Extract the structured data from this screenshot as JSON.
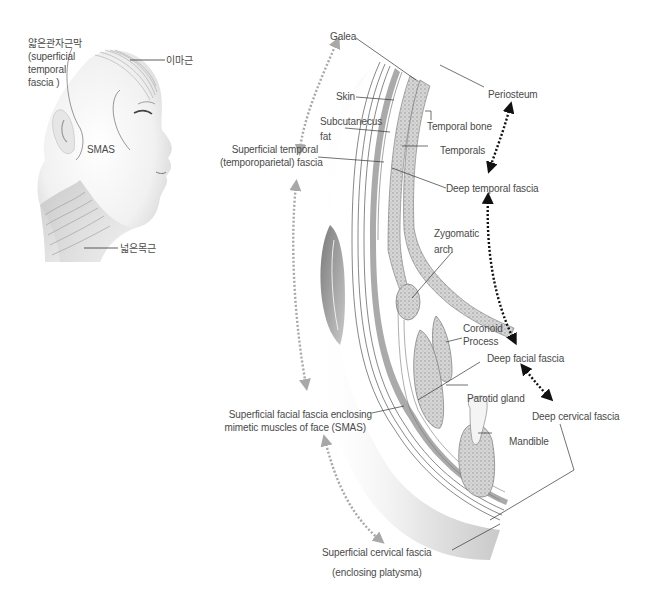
{
  "figure": {
    "face_panel": {
      "labels": {
        "superficial_temporal_kr": "얇은관자근막",
        "superficial_temporal_en_1": "(superficial",
        "superficial_temporal_en_2": "temporal",
        "superficial_temporal_en_3": "fascia )",
        "frontalis_kr": "이마근",
        "smas": "SMAS",
        "platysma_kr": "넓은목근"
      }
    },
    "section_panel": {
      "labels": {
        "galea": "Galea",
        "skin": "Skin",
        "subcutaneous_1": "Subcutanecus",
        "subcutaneous_2": "fat",
        "superficial_temporal_1": "Superficial temporal",
        "superficial_temporal_2": "(temporoparietal) fascia",
        "periosteum": "Periosteum",
        "temporal_bone": "Temporal bone",
        "temporals": "Temporals",
        "deep_temporal_fascia": "Deep temporal fascia",
        "zygomatic_1": "Zygomatic",
        "zygomatic_2": "arch",
        "coronoid_1": "Coronoid",
        "coronoid_2": "Process",
        "deep_facial_fascia": "Deep facial fascia",
        "parotid_gland": "Parotid gland",
        "deep_cervical_fascia": "Deep cervical fascia",
        "mandible": "Mandible",
        "smas_1": "Superficial facial fascia enclosing",
        "smas_2": "mimetic muscles of face (SMAS)",
        "superficial_cervical_1": "Superficial cervical fascia",
        "superficial_cervical_2": "(enclosing platysma)"
      }
    },
    "colors": {
      "label_text": "#4a4a4a",
      "leader_line": "#333333",
      "superficial_arrow": "#a8a8a8",
      "deep_arrow": "#111111",
      "tissue_dark": "#8a8a8a",
      "tissue_light": "#d9d9d9"
    }
  }
}
